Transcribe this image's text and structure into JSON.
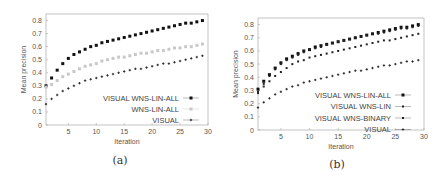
{
  "chart_data": [
    {
      "panel": "(a)",
      "type": "scatter",
      "title": "",
      "xlabel": "Iteration",
      "ylabel": "Mean precision",
      "xlim": [
        1,
        30
      ],
      "ylim": [
        0,
        0.85
      ],
      "xticks": [
        5,
        10,
        15,
        20,
        25,
        30
      ],
      "yticks": [
        0,
        0.1,
        0.2,
        0.3,
        0.4,
        0.5,
        0.6,
        0.7,
        0.8
      ],
      "grid": false,
      "legend_position": "lower right",
      "x": [
        1,
        2,
        3,
        4,
        5,
        6,
        7,
        8,
        9,
        10,
        11,
        12,
        13,
        14,
        15,
        16,
        17,
        18,
        19,
        20,
        21,
        22,
        23,
        24,
        25,
        26,
        27,
        28,
        29
      ],
      "series": [
        {
          "name": "VISUAL WNS-LIN-ALL",
          "marker": "square",
          "color": "#111111",
          "values": [
            0.3,
            0.36,
            0.42,
            0.47,
            0.51,
            0.54,
            0.56,
            0.58,
            0.6,
            0.61,
            0.63,
            0.64,
            0.65,
            0.66,
            0.67,
            0.68,
            0.69,
            0.7,
            0.71,
            0.72,
            0.73,
            0.74,
            0.75,
            0.76,
            0.77,
            0.78,
            0.78,
            0.79,
            0.8
          ]
        },
        {
          "name": "WNS-LIN-ALL",
          "marker": "square",
          "color": "#c8c8c8",
          "values": [
            0.29,
            0.31,
            0.34,
            0.37,
            0.39,
            0.41,
            0.43,
            0.45,
            0.46,
            0.47,
            0.49,
            0.5,
            0.51,
            0.52,
            0.52,
            0.53,
            0.54,
            0.55,
            0.55,
            0.56,
            0.57,
            0.57,
            0.58,
            0.59,
            0.59,
            0.6,
            0.6,
            0.61,
            0.62
          ]
        },
        {
          "name": "VISUAL",
          "marker": "plus",
          "color": "#222222",
          "values": [
            0.16,
            0.2,
            0.23,
            0.26,
            0.28,
            0.3,
            0.32,
            0.34,
            0.35,
            0.36,
            0.37,
            0.38,
            0.39,
            0.4,
            0.41,
            0.42,
            0.43,
            0.43,
            0.44,
            0.45,
            0.46,
            0.47,
            0.47,
            0.48,
            0.49,
            0.5,
            0.51,
            0.52,
            0.53
          ]
        }
      ]
    },
    {
      "panel": "(b)",
      "type": "scatter",
      "title": "",
      "xlabel": "Iteration",
      "ylabel": "Mean precision",
      "xlim": [
        1,
        30
      ],
      "ylim": [
        0,
        0.85
      ],
      "xticks": [
        5,
        10,
        15,
        20,
        25,
        30
      ],
      "yticks": [
        0,
        0.1,
        0.2,
        0.3,
        0.4,
        0.5,
        0.6,
        0.7,
        0.8
      ],
      "grid": false,
      "legend_position": "lower right",
      "x": [
        1,
        2,
        3,
        4,
        5,
        6,
        7,
        8,
        9,
        10,
        11,
        12,
        13,
        14,
        15,
        16,
        17,
        18,
        19,
        20,
        21,
        22,
        23,
        24,
        25,
        26,
        27,
        28,
        29
      ],
      "series": [
        {
          "name": "VISUAL WNS-LIN-ALL",
          "marker": "square",
          "color": "#111111",
          "values": [
            0.31,
            0.37,
            0.42,
            0.47,
            0.51,
            0.54,
            0.56,
            0.58,
            0.6,
            0.61,
            0.63,
            0.64,
            0.65,
            0.66,
            0.67,
            0.68,
            0.69,
            0.7,
            0.71,
            0.72,
            0.73,
            0.74,
            0.75,
            0.76,
            0.77,
            0.78,
            0.78,
            0.79,
            0.8
          ]
        },
        {
          "name": "VISUAL WNS-LIN",
          "marker": "dot",
          "color": "#222222",
          "values": [
            0.29,
            0.35,
            0.41,
            0.46,
            0.5,
            0.53,
            0.55,
            0.57,
            0.59,
            0.61,
            0.62,
            0.63,
            0.65,
            0.66,
            0.67,
            0.68,
            0.69,
            0.7,
            0.71,
            0.72,
            0.73,
            0.73,
            0.74,
            0.75,
            0.76,
            0.77,
            0.77,
            0.78,
            0.79
          ]
        },
        {
          "name": "VISUAL WNS-BINARY",
          "marker": "dot",
          "color": "#222222",
          "values": [
            0.28,
            0.33,
            0.37,
            0.41,
            0.44,
            0.47,
            0.5,
            0.52,
            0.53,
            0.55,
            0.56,
            0.57,
            0.58,
            0.59,
            0.6,
            0.61,
            0.62,
            0.63,
            0.64,
            0.65,
            0.66,
            0.67,
            0.68,
            0.68,
            0.69,
            0.7,
            0.71,
            0.72,
            0.73
          ]
        },
        {
          "name": "VISUAL",
          "marker": "plus",
          "color": "#222222",
          "values": [
            0.17,
            0.21,
            0.24,
            0.27,
            0.29,
            0.31,
            0.33,
            0.34,
            0.36,
            0.37,
            0.38,
            0.39,
            0.4,
            0.41,
            0.42,
            0.43,
            0.44,
            0.45,
            0.45,
            0.46,
            0.47,
            0.48,
            0.49,
            0.49,
            0.5,
            0.51,
            0.52,
            0.52,
            0.53
          ]
        }
      ]
    }
  ],
  "captions": {
    "a": "(a)",
    "b": "(b)"
  }
}
